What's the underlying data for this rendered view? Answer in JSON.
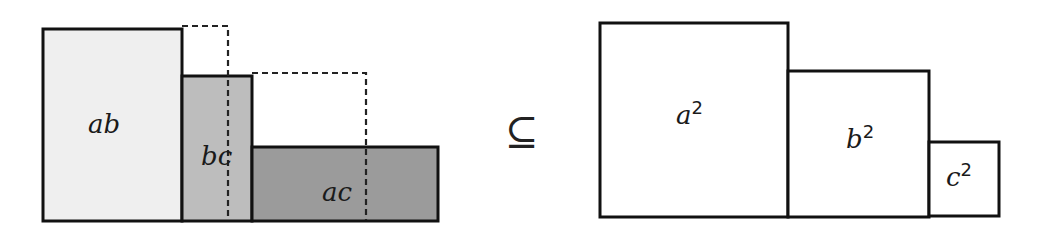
{
  "diagram": {
    "left": {
      "rects": [
        {
          "id": "ab",
          "label": "ab",
          "x": 43,
          "y": 29,
          "w": 139,
          "h": 192,
          "fill": "#efefef"
        },
        {
          "id": "bc",
          "label": "bc",
          "x": 182,
          "y": 76,
          "w": 70,
          "h": 145,
          "fill": "#bdbdbd"
        },
        {
          "id": "ac",
          "label": "ac",
          "x": 252,
          "y": 147,
          "w": 186,
          "h": 74,
          "fill": "#9b9b9b"
        }
      ],
      "dashed_boxes": [
        {
          "id": "dash-b",
          "x": 182,
          "y": 26,
          "w": 46,
          "h": 194
        },
        {
          "id": "dash-c",
          "x": 252,
          "y": 73,
          "w": 114,
          "h": 147
        }
      ]
    },
    "relation": {
      "symbol": "⊆",
      "meaning": "subset-or-equal"
    },
    "right": {
      "rects": [
        {
          "id": "a2",
          "base": "a",
          "exp": "2",
          "x": 600,
          "y": 23,
          "w": 188,
          "h": 194
        },
        {
          "id": "b2",
          "base": "b",
          "exp": "2",
          "x": 788,
          "y": 71,
          "w": 141,
          "h": 146
        },
        {
          "id": "c2",
          "base": "c",
          "exp": "2",
          "x": 929,
          "y": 142,
          "w": 70,
          "h": 74
        }
      ]
    },
    "colors": {
      "stroke": "#111111",
      "dash": "#222222",
      "background": "#ffffff"
    }
  }
}
